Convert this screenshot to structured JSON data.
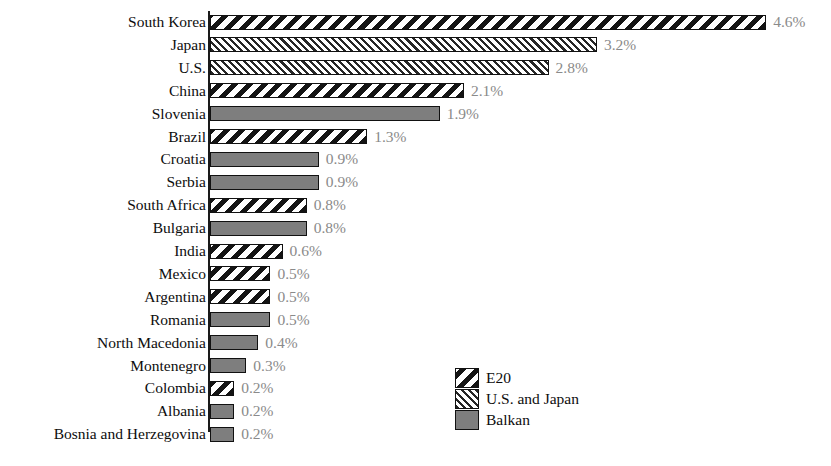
{
  "chart_data": {
    "type": "bar",
    "orientation": "horizontal",
    "title": "",
    "subtitle": "",
    "xlabel": "",
    "ylabel": "",
    "xlim": [
      0,
      4.6
    ],
    "grid": false,
    "value_suffix": "%",
    "legend_position": "bottom-right",
    "categories": [
      "South Korea",
      "Japan",
      "U.S.",
      "China",
      "Slovenia",
      "Brazil",
      "Croatia",
      "Serbia",
      "South Africa",
      "Bulgaria",
      "India",
      "Mexico",
      "Argentina",
      "Romania",
      "North Macedonia",
      "Montenegro",
      "Colombia",
      "Albania",
      "Bosnia and Herzegovina"
    ],
    "values": [
      4.6,
      3.2,
      2.8,
      2.1,
      1.9,
      1.3,
      0.9,
      0.9,
      0.8,
      0.8,
      0.6,
      0.5,
      0.5,
      0.5,
      0.4,
      0.3,
      0.2,
      0.2,
      0.2
    ],
    "value_labels": [
      "4.6%",
      "3.2%",
      "2.8%",
      "2.1%",
      "1.9%",
      "1.3%",
      "0.9%",
      "0.9%",
      "0.8%",
      "0.8%",
      "0.6%",
      "0.5%",
      "0.5%",
      "0.5%",
      "0.4%",
      "0.3%",
      "0.2%",
      "0.2%",
      "0.2%"
    ],
    "groups": [
      "E20",
      "U.S. and Japan",
      "U.S. and Japan",
      "E20",
      "Balkan",
      "E20",
      "Balkan",
      "Balkan",
      "E20",
      "Balkan",
      "E20",
      "E20",
      "E20",
      "Balkan",
      "Balkan",
      "Balkan",
      "E20",
      "Balkan",
      "Balkan"
    ],
    "series": [
      {
        "name": "E20",
        "pattern": "wide-backslash-hatch"
      },
      {
        "name": "U.S. and Japan",
        "pattern": "fine-forwardslash-hatch"
      },
      {
        "name": "Balkan",
        "pattern": "solid-gray"
      }
    ]
  },
  "legend": {
    "items": [
      {
        "label": "E20",
        "pattern": "wide-backslash-hatch"
      },
      {
        "label": "U.S. and Japan",
        "pattern": "fine-forwardslash-hatch"
      },
      {
        "label": "Balkan",
        "pattern": "solid-gray"
      }
    ]
  },
  "colors": {
    "background": "#ffffff",
    "axis": "#1a1a1a",
    "category_label": "#0d0d0d",
    "value_label": "#8a8a8a",
    "balkan_fill": "#7e7e7e",
    "hatch_stroke": "#141414"
  }
}
